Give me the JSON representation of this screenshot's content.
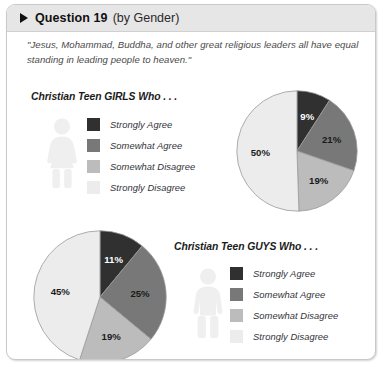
{
  "header": {
    "bullet_icon": "triangle-right-icon",
    "title": "Question 19",
    "subtitle": "(by Gender)"
  },
  "quote": "\"Jesus, Mohammad, Buddha, and other great religious leaders all have equal standing in leading people to heaven.\"",
  "girls": {
    "section_title": "Christian Teen GIRLS Who . . .",
    "figure_icon": "female-figure-icon",
    "legend": [
      {
        "label": "Strongly Agree",
        "color": "#303030"
      },
      {
        "label": "Somewhat Agree",
        "color": "#787878"
      },
      {
        "label": "Somewhat Disagree",
        "color": "#bcbcbc"
      },
      {
        "label": "Strongly Disagree",
        "color": "#ececec"
      }
    ]
  },
  "guys": {
    "section_title": "Christian Teen GUYS Who . . .",
    "figure_icon": "male-figure-icon",
    "legend": [
      {
        "label": "Strongly Agree",
        "color": "#303030"
      },
      {
        "label": "Somewhat Agree",
        "color": "#787878"
      },
      {
        "label": "Somewhat Disagree",
        "color": "#bcbcbc"
      },
      {
        "label": "Strongly Disagree",
        "color": "#ececec"
      }
    ]
  },
  "chart_data": [
    {
      "type": "pie",
      "title": "Christian Teen GIRLS Who . . .",
      "categories": [
        "Strongly Agree",
        "Somewhat Agree",
        "Somewhat Disagree",
        "Strongly Disagree"
      ],
      "values": [
        9,
        21,
        19,
        50
      ],
      "labels": [
        "9%",
        "21%",
        "19%",
        "50%"
      ],
      "colors": [
        "#303030",
        "#787878",
        "#bcbcbc",
        "#ececec"
      ],
      "units": "percent",
      "start_angle_deg": 0,
      "direction": "clockwise",
      "legend_position": "left"
    },
    {
      "type": "pie",
      "title": "Christian Teen GUYS Who . . .",
      "categories": [
        "Strongly Agree",
        "Somewhat Agree",
        "Somewhat Disagree",
        "Strongly Disagree"
      ],
      "values": [
        11,
        25,
        19,
        45
      ],
      "labels": [
        "11%",
        "25%",
        "19%",
        "45%"
      ],
      "colors": [
        "#303030",
        "#787878",
        "#bcbcbc",
        "#ececec"
      ],
      "units": "percent",
      "start_angle_deg": 0,
      "direction": "clockwise",
      "legend_position": "right"
    }
  ]
}
